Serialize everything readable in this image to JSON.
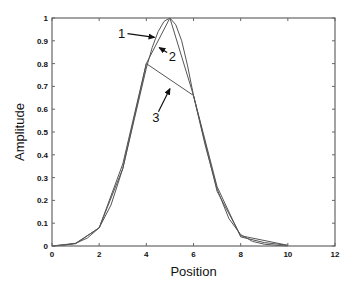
{
  "chart_data": {
    "type": "line",
    "title": "",
    "xlabel": "Position",
    "ylabel": "Amplitude",
    "xlim": [
      0,
      12
    ],
    "ylim": [
      0,
      1
    ],
    "xticks": [
      0,
      2,
      4,
      6,
      8,
      10,
      12
    ],
    "yticks": [
      0,
      0.1,
      0.2,
      0.3,
      0.4,
      0.5,
      0.6,
      0.7,
      0.8,
      0.9,
      1
    ],
    "xtick_labels": [
      "0",
      "2",
      "4",
      "6",
      "8",
      "10",
      "12"
    ],
    "ytick_labels": [
      "0",
      "0.1",
      "0.2",
      "0.3",
      "0.4",
      "0.5",
      "0.6",
      "0.7",
      "0.8",
      "0.9",
      "1"
    ],
    "grid": false,
    "legend": null,
    "series": [
      {
        "name": "1",
        "style": "smooth",
        "x": [
          0,
          0.5,
          1,
          1.5,
          2,
          2.5,
          3,
          3.5,
          4,
          4.25,
          4.5,
          4.75,
          5,
          5.25,
          5.5,
          5.75,
          6,
          6.5,
          7,
          7.5,
          8,
          8.5,
          9,
          9.5,
          10
        ],
        "y": [
          0.0,
          0.003,
          0.012,
          0.035,
          0.08,
          0.18,
          0.34,
          0.56,
          0.78,
          0.87,
          0.94,
          0.985,
          1.0,
          0.97,
          0.9,
          0.79,
          0.66,
          0.44,
          0.25,
          0.12,
          0.05,
          0.02,
          0.008,
          0.003,
          0.0
        ]
      },
      {
        "name": "2",
        "style": "piecewise-linear",
        "x": [
          0,
          1,
          2,
          3,
          4,
          5,
          6,
          7,
          8,
          9,
          10
        ],
        "y": [
          0.0,
          0.01,
          0.08,
          0.36,
          0.8,
          1.0,
          0.66,
          0.26,
          0.04,
          0.015,
          0.003
        ]
      },
      {
        "name": "3",
        "style": "piecewise-linear",
        "x": [
          0,
          1,
          2,
          3,
          4,
          6,
          7,
          8,
          10
        ],
        "y": [
          0.0,
          0.012,
          0.08,
          0.34,
          0.8,
          0.66,
          0.24,
          0.045,
          0.003
        ]
      }
    ],
    "annotations": [
      {
        "text": "1",
        "x_text": 2.95,
        "y_text": 0.935,
        "arrow_to": [
          4.35,
          0.915
        ]
      },
      {
        "text": "2",
        "x_text": 5.1,
        "y_text": 0.835,
        "arrow_to": [
          4.55,
          0.87
        ]
      },
      {
        "text": "3",
        "x_text": 4.4,
        "y_text": 0.565,
        "arrow_to": [
          5.0,
          0.69
        ]
      }
    ],
    "line_color": "#555555",
    "axes_color": "#666666"
  }
}
